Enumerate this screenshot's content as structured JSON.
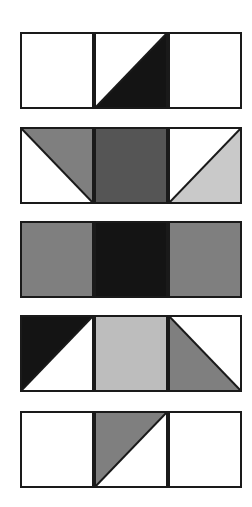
{
  "diagram": {
    "colors": {
      "white": "#ffffff",
      "black": "#141414",
      "dark_gray": "#555555",
      "medium_gray": "#7f7f7f",
      "light_gray": "#bdbdbd",
      "lighter_gray": "#c9c9c9",
      "outline": "#1a1a1a"
    },
    "strips": [
      {
        "top": 32,
        "tiles": [
          {
            "type": "solid",
            "fill": "white"
          },
          {
            "type": "diagonal",
            "diagonal": "bl-tr",
            "upper": "white",
            "lower": "black"
          },
          {
            "type": "solid",
            "fill": "white"
          }
        ]
      },
      {
        "top": 127,
        "tiles": [
          {
            "type": "diagonal",
            "diagonal": "tl-br",
            "upper": "medium_gray",
            "lower": "white"
          },
          {
            "type": "solid",
            "fill": "dark_gray"
          },
          {
            "type": "diagonal",
            "diagonal": "bl-tr",
            "upper": "white",
            "lower": "lighter_gray"
          }
        ]
      },
      {
        "top": 221,
        "tiles": [
          {
            "type": "solid",
            "fill": "medium_gray"
          },
          {
            "type": "solid",
            "fill": "black"
          },
          {
            "type": "solid",
            "fill": "medium_gray"
          }
        ]
      },
      {
        "top": 315,
        "tiles": [
          {
            "type": "diagonal",
            "diagonal": "bl-tr",
            "upper": "black",
            "lower": "white"
          },
          {
            "type": "solid",
            "fill": "light_gray"
          },
          {
            "type": "diagonal",
            "diagonal": "tl-br",
            "upper": "white",
            "lower": "medium_gray"
          }
        ]
      },
      {
        "top": 411,
        "tiles": [
          {
            "type": "solid",
            "fill": "white"
          },
          {
            "type": "diagonal",
            "diagonal": "bl-tr",
            "upper": "medium_gray",
            "lower": "white"
          },
          {
            "type": "solid",
            "fill": "white"
          }
        ]
      }
    ]
  }
}
